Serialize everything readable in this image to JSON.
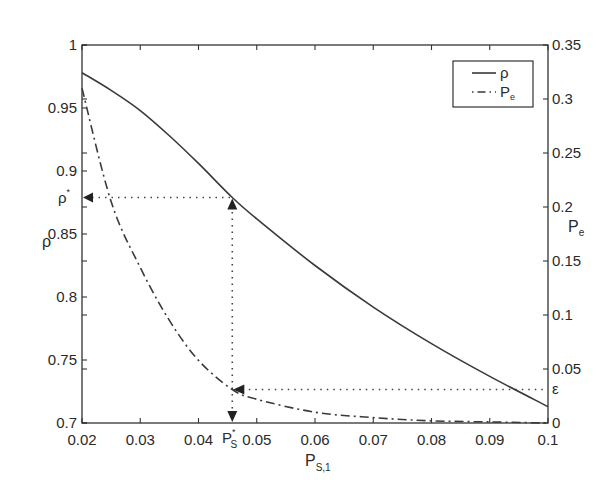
{
  "chart_data": {
    "type": "line",
    "title": "",
    "xlabel": "P_S,1",
    "xlabel_main": "P",
    "xlabel_sub": "S,1",
    "ylabel_left": "ρ",
    "ylabel_right_main": "P",
    "ylabel_right_sub": "e",
    "xlim": [
      0.02,
      0.1
    ],
    "ylim_left": [
      0.7,
      1.0
    ],
    "ylim_right": [
      0,
      0.35
    ],
    "grid": false,
    "legend_position": "upper right",
    "x_ticks": [
      "0.02",
      "0.03",
      "0.04",
      "0.05",
      "0.06",
      "0.07",
      "0.08",
      "0.09",
      "0.1"
    ],
    "x_tick_values": [
      0.02,
      0.03,
      0.04,
      0.05,
      0.06,
      0.07,
      0.08,
      0.09,
      0.1
    ],
    "y_left_ticks": [
      "0.7",
      "0.75",
      "0.8",
      "0.85",
      "0.9",
      "0.95",
      "1"
    ],
    "y_left_tick_values": [
      0.7,
      0.75,
      0.8,
      0.85,
      0.9,
      0.95,
      1.0
    ],
    "y_right_ticks": [
      "0",
      "0.05",
      "0.1",
      "0.15",
      "0.2",
      "0.25",
      "0.3",
      "0.35"
    ],
    "y_right_tick_values": [
      0,
      0.05,
      0.1,
      0.15,
      0.2,
      0.25,
      0.3,
      0.35
    ],
    "x": [
      0.02,
      0.025,
      0.03,
      0.035,
      0.04,
      0.0458,
      0.05,
      0.06,
      0.07,
      0.08,
      0.09,
      0.1
    ],
    "series": [
      {
        "name": "ρ",
        "axis": "left",
        "style": "solid",
        "values": [
          0.978,
          0.964,
          0.948,
          0.928,
          0.906,
          0.879,
          0.862,
          0.825,
          0.792,
          0.763,
          0.737,
          0.713
        ]
      },
      {
        "name": "P_e",
        "axis": "right",
        "style": "dash-dot",
        "values": [
          0.31,
          0.205,
          0.144,
          0.095,
          0.058,
          0.031,
          0.022,
          0.01,
          0.005,
          0.002,
          0.001,
          0.0
        ]
      }
    ],
    "legend": [
      {
        "label_main": "ρ",
        "label_sub": "",
        "style": "solid"
      },
      {
        "label_main": "P",
        "label_sub": "e",
        "style": "dash-dot"
      }
    ],
    "annotations": {
      "rho_star": {
        "label": "ρ",
        "sup": "*",
        "value": 0.879
      },
      "ps_star": {
        "label": "P",
        "sup": "*",
        "sub": "S",
        "value": 0.0458
      },
      "epsilon": {
        "label": "ε",
        "value": 0.031
      }
    }
  }
}
